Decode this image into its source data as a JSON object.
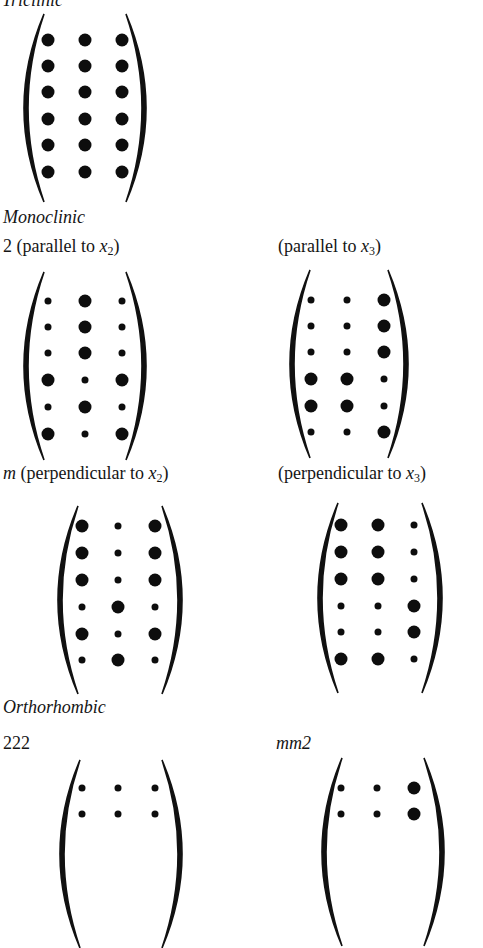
{
  "sections": {
    "triclinic": {
      "title": "Triclinic"
    },
    "monoclinic": {
      "title": "Monoclinic"
    },
    "orthorhombic": {
      "title": "Orthorhombic"
    }
  },
  "labels": {
    "mono_2_x2_prefix": "2 (parallel to ",
    "mono_2_x2_var": "x",
    "mono_2_x2_sub": "2",
    "mono_2_x2_suffix": ")",
    "mono_2_x3_prefix": "(parallel to ",
    "mono_2_x3_var": "x",
    "mono_2_x3_sub": "3",
    "mono_2_x3_suffix": ")",
    "mono_m_x2_sym": "m",
    "mono_m_x2_prefix": " (perpendicular to ",
    "mono_m_x2_var": "x",
    "mono_m_x2_sub": "2",
    "mono_m_x2_suffix": ")",
    "mono_m_x3_prefix": "(perpendicular to ",
    "mono_m_x3_var": "x",
    "mono_m_x3_sub": "3",
    "mono_m_x3_suffix": ")",
    "ortho_222": "222",
    "ortho_mm2": "mm2"
  },
  "legend": {
    "L": "large dot (non-zero coefficient)",
    "S": "small dot (zero coefficient)"
  },
  "matrices": [
    {
      "id": "triclinic-1",
      "x": 10,
      "y": 14,
      "w": 150,
      "h": 188,
      "cols": [
        38,
        75,
        112
      ],
      "rows": [
        26,
        52,
        78,
        105,
        131,
        158
      ],
      "pattern": [
        [
          "L",
          "L",
          "L"
        ],
        [
          "L",
          "L",
          "L"
        ],
        [
          "L",
          "L",
          "L"
        ],
        [
          "L",
          "L",
          "L"
        ],
        [
          "L",
          "L",
          "L"
        ],
        [
          "L",
          "L",
          "L"
        ]
      ]
    },
    {
      "id": "monoclinic-2-parallel-x2",
      "x": 10,
      "y": 272,
      "w": 150,
      "h": 188,
      "cols": [
        38,
        75,
        112
      ],
      "rows": [
        29,
        55,
        81,
        108,
        135,
        162
      ],
      "pattern": [
        [
          "S",
          "L",
          "S"
        ],
        [
          "S",
          "L",
          "S"
        ],
        [
          "S",
          "L",
          "S"
        ],
        [
          "L",
          "S",
          "L"
        ],
        [
          "S",
          "L",
          "S"
        ],
        [
          "L",
          "S",
          "L"
        ]
      ]
    },
    {
      "id": "monoclinic-2-parallel-x3",
      "x": 276,
      "y": 270,
      "w": 146,
      "h": 188,
      "cols": [
        35,
        71,
        108
      ],
      "rows": [
        30,
        56,
        82,
        109,
        136,
        162
      ],
      "pattern": [
        [
          "S",
          "S",
          "L"
        ],
        [
          "S",
          "S",
          "L"
        ],
        [
          "S",
          "S",
          "L"
        ],
        [
          "L",
          "L",
          "S"
        ],
        [
          "L",
          "L",
          "S"
        ],
        [
          "S",
          "S",
          "L"
        ]
      ]
    },
    {
      "id": "monoclinic-m-perpendicular-x2",
      "x": 44,
      "y": 506,
      "w": 152,
      "h": 188,
      "cols": [
        38,
        74,
        111
      ],
      "rows": [
        20,
        47,
        74,
        101,
        128,
        154
      ],
      "pattern": [
        [
          "L",
          "S",
          "L"
        ],
        [
          "L",
          "S",
          "L"
        ],
        [
          "L",
          "S",
          "L"
        ],
        [
          "S",
          "L",
          "S"
        ],
        [
          "L",
          "S",
          "L"
        ],
        [
          "S",
          "L",
          "S"
        ]
      ]
    },
    {
      "id": "monoclinic-m-perpendicular-x3",
      "x": 304,
      "y": 503,
      "w": 152,
      "h": 190,
      "cols": [
        37,
        74,
        110
      ],
      "rows": [
        22,
        49,
        76,
        103,
        129,
        156
      ],
      "pattern": [
        [
          "L",
          "L",
          "S"
        ],
        [
          "L",
          "L",
          "S"
        ],
        [
          "L",
          "L",
          "S"
        ],
        [
          "S",
          "S",
          "L"
        ],
        [
          "S",
          "S",
          "L"
        ],
        [
          "L",
          "L",
          "S"
        ]
      ]
    },
    {
      "id": "orthorhombic-222",
      "x": 46,
      "y": 760,
      "w": 150,
      "h": 188,
      "cols": [
        36,
        72,
        109
      ],
      "rows": [
        28,
        54
      ],
      "pattern": [
        [
          "S",
          "S",
          "S"
        ],
        [
          "S",
          "S",
          "S"
        ]
      ]
    },
    {
      "id": "orthorhombic-mm2",
      "x": 308,
      "y": 758,
      "w": 150,
      "h": 188,
      "cols": [
        33,
        69,
        106
      ],
      "rows": [
        30,
        56
      ],
      "pattern": [
        [
          "S",
          "S",
          "L"
        ],
        [
          "S",
          "S",
          "L"
        ]
      ]
    }
  ]
}
